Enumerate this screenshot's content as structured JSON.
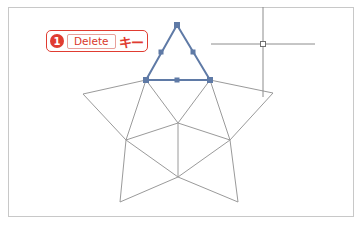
{
  "callout": {
    "step_number": "1",
    "key_label": "Delete",
    "key_suffix": "キー",
    "accent_color": "#e03c31"
  },
  "diagram": {
    "colors": {
      "line": "#9a9a9a",
      "selection": "#5f7aa6",
      "anchor": "#5f7aa6",
      "cursor": "#8c8c8c",
      "frame": "#c8c8c8"
    },
    "star_points": {
      "top": [
        177,
        25
      ],
      "inner_top_left": [
        146,
        80
      ],
      "inner_top_right": [
        210,
        80
      ],
      "left_tip": [
        83,
        94
      ],
      "right_tip": [
        273,
        93
      ],
      "inner_left": [
        126,
        140
      ],
      "inner_right": [
        230,
        140
      ],
      "center_upper": [
        178,
        123
      ],
      "center_lower": [
        178,
        177
      ],
      "bottom_left": [
        120,
        202
      ],
      "bottom_right": [
        238,
        202
      ]
    },
    "selected_triangle_anchors": [
      [
        177,
        25
      ],
      [
        161,
        52
      ],
      [
        193,
        52
      ],
      [
        146,
        80
      ],
      [
        177,
        80
      ],
      [
        210,
        80
      ]
    ],
    "crosshair": {
      "x": 263,
      "y": 44
    }
  }
}
